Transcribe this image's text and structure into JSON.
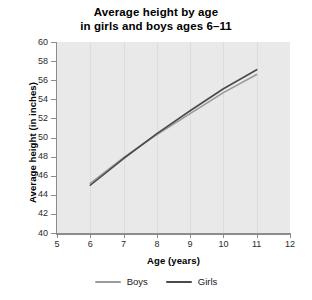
{
  "chart_data": {
    "type": "line",
    "title": "Average height by age in girls and boys ages 6–11",
    "title_line1": "Average height by age",
    "title_line2": "in girls and boys ages 6–11",
    "xlabel": "Age (years)",
    "ylabel": "Average height (in inches)",
    "xlim": [
      5,
      12
    ],
    "ylim": [
      40,
      60
    ],
    "x": [
      6,
      7,
      8,
      9,
      10,
      11
    ],
    "xticks": [
      5,
      6,
      7,
      8,
      9,
      10,
      11,
      12
    ],
    "xtick_labels": [
      "5",
      "6",
      "7",
      "8",
      "9",
      "10",
      "11",
      "12"
    ],
    "yticks": [
      40,
      42,
      44,
      46,
      48,
      50,
      52,
      54,
      56,
      58,
      60
    ],
    "ytick_labels": [
      "40",
      "42",
      "44",
      "46",
      "48",
      "50",
      "52",
      "54",
      "56",
      "58",
      "60"
    ],
    "grid": "vertical",
    "legend_position": "bottom",
    "plot_background": "#e9e9e9",
    "series": [
      {
        "name": "Boys",
        "color": "#9a9a9a",
        "values": [
          45.2,
          47.9,
          50.3,
          52.5,
          54.7,
          56.6
        ]
      },
      {
        "name": "Girls",
        "color": "#4a4a4a",
        "values": [
          45.0,
          47.8,
          50.4,
          52.8,
          55.1,
          57.1
        ]
      }
    ]
  },
  "legend": {
    "items": [
      {
        "label": "Boys",
        "color": "#9a9a9a"
      },
      {
        "label": "Girls",
        "color": "#4a4a4a"
      }
    ]
  }
}
